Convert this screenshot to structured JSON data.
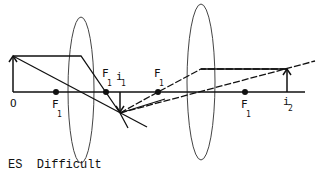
{
  "diagram": {
    "labels": {
      "object": "O",
      "focal_main": "F",
      "focal_sub": "1",
      "image1_main": "i",
      "image1_sub": "1",
      "image2_main": "i",
      "image2_sub": "2"
    },
    "lenses": [
      {
        "name": "lens-1",
        "cx": 81,
        "cy": 90,
        "rx": 13,
        "ry": 73
      },
      {
        "name": "lens-2",
        "cx": 201,
        "cy": 82,
        "rx": 14,
        "ry": 78
      }
    ],
    "focal_points": [
      {
        "x": 56,
        "label_pos": "below"
      },
      {
        "x": 106,
        "label_pos": "above"
      },
      {
        "x": 158,
        "label_pos": "above"
      },
      {
        "x": 245,
        "label_pos": "below"
      }
    ],
    "axis": {
      "y": 92,
      "x_start": 13,
      "x_end": 305
    },
    "object_arrow": {
      "x": 13,
      "y_base": 92,
      "y_tip": 57
    },
    "image1_arrow": {
      "x": 120,
      "y_base": 92,
      "y_tip": 110
    },
    "image2_arrow": {
      "x": 287,
      "y_base": 92,
      "y_tip": 69
    },
    "colors": {
      "stroke": "#111111",
      "lens": "#444444",
      "background": "#ffffff"
    }
  },
  "caption": {
    "category": "ES",
    "difficulty": "Difficult"
  }
}
